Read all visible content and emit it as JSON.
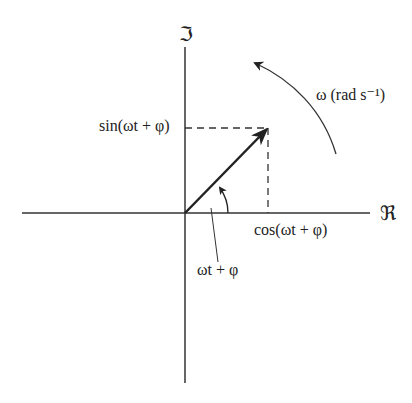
{
  "diagram": {
    "type": "phasor",
    "imag_axis_label": "ℑ",
    "real_axis_label": "ℜ",
    "sin_label": "sin(ωt + φ)",
    "cos_label": "cos(ωt + φ)",
    "angle_label": "ωt + φ",
    "rotation_label": "ω (rad s⁻¹)",
    "colors": {
      "line": "#222222",
      "background": "#ffffff"
    }
  }
}
